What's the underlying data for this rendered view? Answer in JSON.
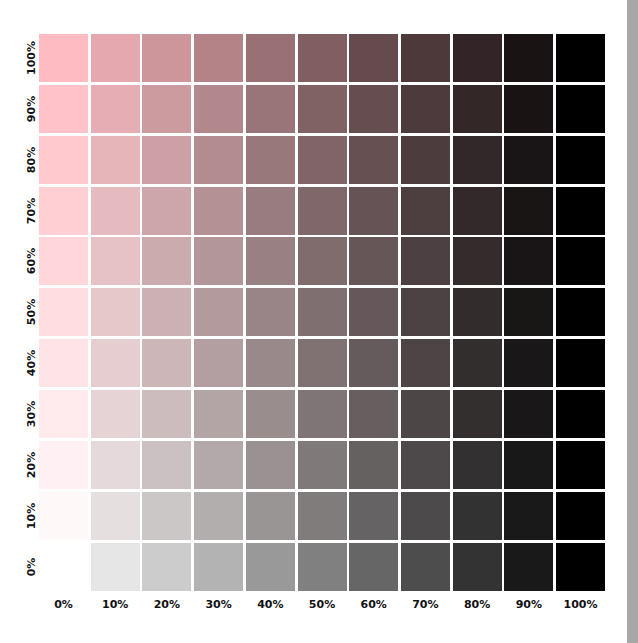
{
  "chart_data": {
    "type": "heatmap",
    "title": "",
    "xlabel": "",
    "ylabel": "",
    "x_ticks": [
      "0%",
      "10%",
      "20%",
      "30%",
      "40%",
      "50%",
      "60%",
      "70%",
      "80%",
      "90%",
      "100%"
    ],
    "y_ticks_top_to_bottom": [
      "100%",
      "90%",
      "80%",
      "70%",
      "60%",
      "50%",
      "40%",
      "30%",
      "20%",
      "10%",
      "0%"
    ],
    "x_values_black_pct": [
      0,
      10,
      20,
      30,
      40,
      50,
      60,
      70,
      80,
      90,
      100
    ],
    "y_values_pink_pct_top_to_bottom": [
      100,
      90,
      80,
      70,
      60,
      50,
      40,
      30,
      20,
      10,
      0
    ],
    "base_color": "#ffbbc2",
    "black_color": "#000000",
    "grid": false,
    "legend": "none",
    "blank_cell": "0% pink / 0% black is white"
  },
  "colors": {
    "background": "#ffffff",
    "side_strip": "#a7a7a7",
    "label_text": "#111111",
    "pink_full": "#ffbbc2"
  }
}
